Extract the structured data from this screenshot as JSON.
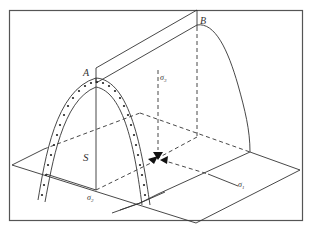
{
  "diagram": {
    "type": "3d-stress-space-yield-surface",
    "labels": {
      "point_a": "A",
      "point_b": "B",
      "s_axis": "S",
      "sigma_1": "σ",
      "sigma_1_sub": "1",
      "sigma_2": "σ",
      "sigma_2_sub": "2",
      "sigma_3": "σ",
      "sigma_3_sub": "3"
    },
    "colors": {
      "line": "#333333",
      "frame": "#555555",
      "background": "#ffffff"
    }
  }
}
